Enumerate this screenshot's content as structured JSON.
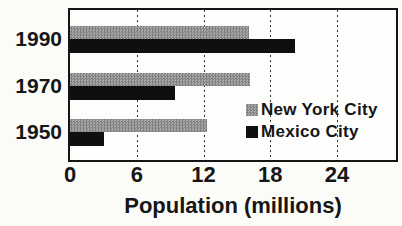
{
  "chart_data": {
    "type": "bar",
    "orientation": "horizontal",
    "title": "",
    "xlabel": "Population (millions)",
    "categories": [
      "1990",
      "1970",
      "1950"
    ],
    "series": [
      {
        "name": "New York City",
        "values": [
          16.1,
          16.2,
          12.3
        ],
        "color": "#9b9b9b",
        "pattern": "halftone-gray"
      },
      {
        "name": "Mexico City",
        "values": [
          20.2,
          9.4,
          3.1
        ],
        "color": "#0f0f0f",
        "pattern": "solid-black"
      }
    ],
    "xlim": [
      0,
      29.3
    ],
    "x_ticks": [
      0,
      6,
      12,
      18,
      24
    ],
    "gridlines": [
      6,
      12,
      18,
      24
    ],
    "grid_style": "dotted-vertical",
    "legend_position": "inside-right",
    "frame_color": "#151515"
  }
}
